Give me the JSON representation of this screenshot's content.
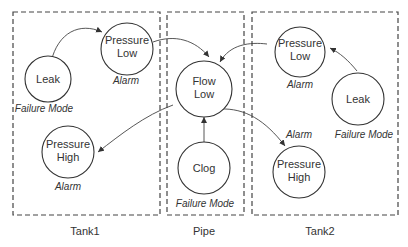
{
  "groups": [
    {
      "id": "tank1",
      "label": "Tank1"
    },
    {
      "id": "pipe",
      "label": "Pipe"
    },
    {
      "id": "tank2",
      "label": "Tank2"
    }
  ],
  "nodes": {
    "tank1_leak": {
      "line1": "Leak",
      "line2": "",
      "type": "Failure Mode"
    },
    "tank1_pressure_low": {
      "line1": "Pressure",
      "line2": "Low",
      "type": "Alarm"
    },
    "tank1_pressure_high": {
      "line1": "Pressure",
      "line2": "High",
      "type": "Alarm"
    },
    "pipe_flow_low": {
      "line1": "Flow",
      "line2": "Low",
      "type": ""
    },
    "pipe_clog": {
      "line1": "Clog",
      "line2": "",
      "type": "Failure Mode"
    },
    "tank2_pressure_low": {
      "line1": "Pressure",
      "line2": "Low",
      "type": "Alarm"
    },
    "tank2_leak": {
      "line1": "Leak",
      "line2": "",
      "type": "Failure Mode"
    },
    "tank2_pressure_high": {
      "line1": "Pressure",
      "line2": "High",
      "type": "Alarm"
    }
  },
  "edges": [
    {
      "from": "tank1_leak",
      "to": "tank1_pressure_low"
    },
    {
      "from": "tank1_pressure_low",
      "to": "pipe_flow_low"
    },
    {
      "from": "tank2_pressure_low",
      "to": "pipe_flow_low"
    },
    {
      "from": "tank2_leak",
      "to": "tank2_pressure_low"
    },
    {
      "from": "pipe_clog",
      "to": "pipe_flow_low"
    },
    {
      "from": "pipe_flow_low",
      "to": "tank1_pressure_high"
    },
    {
      "from": "pipe_flow_low",
      "to": "tank2_pressure_high"
    }
  ]
}
